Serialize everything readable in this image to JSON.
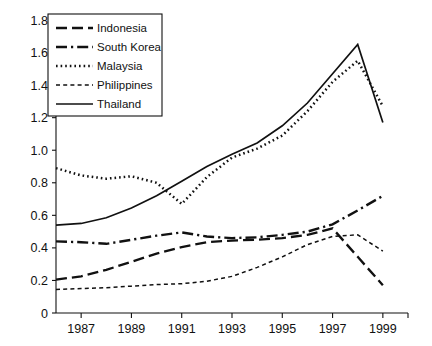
{
  "chart_data": {
    "type": "line",
    "title": "",
    "subtitle": "",
    "xlabel": "",
    "ylabel": "",
    "xlim": [
      1986,
      2000
    ],
    "ylim": [
      0,
      1.8
    ],
    "grid": false,
    "legend_position": "top-left",
    "x_ticks": [
      1987,
      1989,
      1991,
      1993,
      1995,
      1997,
      1999
    ],
    "x_tick_labels": [
      "1987",
      "1989",
      "1991",
      "1993",
      "1995",
      "1997",
      "1999"
    ],
    "y_ticks": [
      0,
      0.2,
      0.4,
      0.6,
      0.8,
      1.0,
      1.2,
      1.4,
      1.6,
      1.8
    ],
    "y_tick_labels": [
      "0",
      "0.2",
      "0.4",
      "0.6",
      "0.8",
      "1.0",
      "1.2",
      "1.4",
      "1.6",
      "1.8"
    ],
    "x": [
      1986,
      1987,
      1988,
      1989,
      1990,
      1991,
      1992,
      1993,
      1994,
      1995,
      1996,
      1997,
      1998,
      1999
    ],
    "series": [
      {
        "name": "Indonesia",
        "dash_style": "long-dash",
        "color": "#111111",
        "values": [
          0.205,
          0.225,
          0.265,
          0.315,
          0.365,
          0.405,
          0.435,
          0.445,
          0.45,
          0.46,
          0.48,
          0.52,
          0.345,
          0.17
        ]
      },
      {
        "name": "South Korea",
        "dash_style": "dash-dot",
        "color": "#111111",
        "values": [
          0.44,
          0.435,
          0.425,
          0.45,
          0.475,
          0.495,
          0.47,
          0.46,
          0.465,
          0.48,
          0.5,
          0.545,
          0.63,
          0.72
        ]
      },
      {
        "name": "Malaysia",
        "dash_style": "dotted",
        "color": "#111111",
        "values": [
          0.89,
          0.845,
          0.825,
          0.84,
          0.8,
          0.67,
          0.835,
          0.955,
          1.01,
          1.09,
          1.24,
          1.42,
          1.55,
          1.27
        ]
      },
      {
        "name": "Philippines",
        "dash_style": "short-dash",
        "color": "#111111",
        "values": [
          0.145,
          0.15,
          0.155,
          0.165,
          0.175,
          0.18,
          0.195,
          0.225,
          0.28,
          0.345,
          0.42,
          0.47,
          0.48,
          0.38
        ]
      },
      {
        "name": "Thailand",
        "dash_style": "solid",
        "color": "#111111",
        "values": [
          0.54,
          0.55,
          0.585,
          0.645,
          0.72,
          0.81,
          0.9,
          0.975,
          1.045,
          1.15,
          1.29,
          1.47,
          1.65,
          1.17
        ]
      }
    ]
  },
  "legend": {
    "items": [
      {
        "label": "Indonesia",
        "dash_style": "long-dash"
      },
      {
        "label": "South Korea",
        "dash_style": "dash-dot"
      },
      {
        "label": "Malaysia",
        "dash_style": "dotted"
      },
      {
        "label": "Philippines",
        "dash_style": "short-dash"
      },
      {
        "label": "Thailand",
        "dash_style": "solid"
      }
    ]
  }
}
